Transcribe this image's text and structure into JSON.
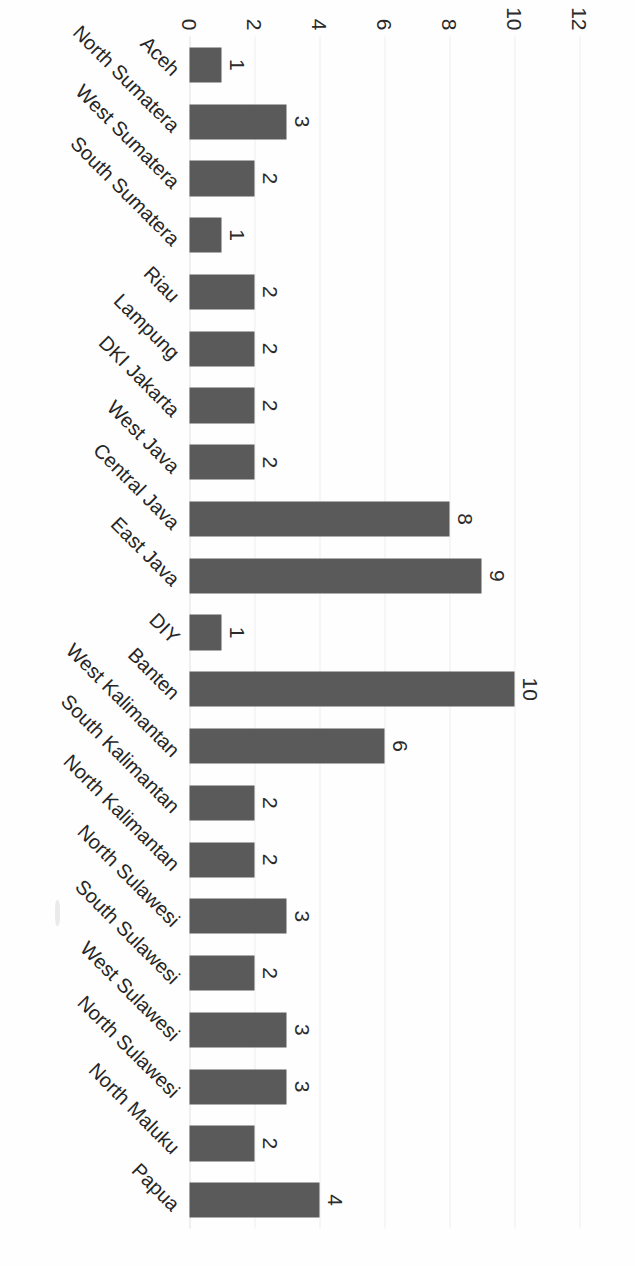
{
  "chart_data": {
    "type": "bar",
    "title": "",
    "xlabel": "",
    "ylabel": "",
    "orientation": "vertical",
    "rotated_scan": true,
    "grid": true,
    "legend": false,
    "ylim": [
      0,
      12
    ],
    "yticks": [
      0,
      2,
      4,
      6,
      8,
      10,
      12
    ],
    "ytick_labels": [
      "0",
      "2",
      "4",
      "6",
      "8",
      "10",
      "12"
    ],
    "bar_color": "#5a5a5a",
    "gridline_color": "#ededed",
    "categories": [
      "Aceh",
      "North Sumatera",
      "West Sumatera",
      "South Sumatera",
      "Riau",
      "Lampung",
      "DKI Jakarta",
      "West Java",
      "Central Java",
      "East Java",
      "DIY",
      "Banten",
      "West Kalimantan",
      "South Kalimantan",
      "North Kalimantan",
      "North Sulawesi",
      "South Sulawesi",
      "West Sulawesi",
      "North Sulawesi",
      "North Maluku",
      "Papua"
    ],
    "values": [
      1,
      3,
      2,
      1,
      2,
      2,
      2,
      2,
      8,
      9,
      1,
      10,
      6,
      2,
      2,
      3,
      2,
      3,
      3,
      2,
      4
    ],
    "data_labels": [
      "1",
      "3",
      "2",
      "1",
      "2",
      "2",
      "2",
      "2",
      "8",
      "9",
      "1",
      "10",
      "6",
      "2",
      "2",
      "3",
      "2",
      "3",
      "3",
      "2",
      "4"
    ]
  }
}
